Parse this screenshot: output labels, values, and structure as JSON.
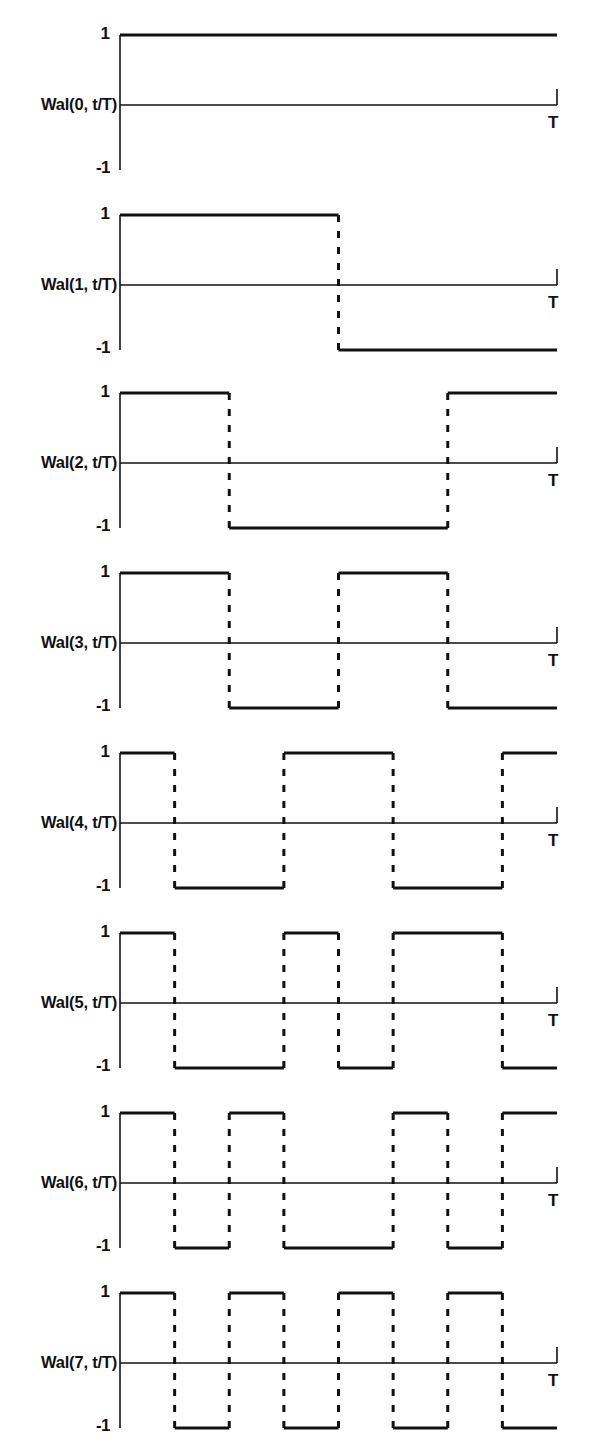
{
  "figure": {
    "title": "",
    "width": 590,
    "height": 1444,
    "ink_color": "#111111",
    "background_color": "#ffffff",
    "solid_stroke_width": 3.2,
    "dashed_stroke_width": 3.0,
    "axis_stroke_width": 1.6,
    "dash_pattern": "7 9"
  },
  "geometry": {
    "panel_height": 180,
    "panel_top_offsets": [
      0,
      180,
      358,
      538,
      718,
      898,
      1078,
      1258
    ],
    "x_axis_left": 120,
    "x_axis_right": 557,
    "y_high": 35,
    "y_zero": 105,
    "y_low": 170,
    "end_tick_height": 16,
    "label_right_edge": 117,
    "t_label_x": 548
  },
  "chart_data": {
    "type": "line",
    "xlabel": "t/T",
    "ylabel": "",
    "xlim": [
      0,
      1
    ],
    "ylim": [
      -1,
      1
    ],
    "grid": false,
    "legend": "none",
    "x_tick_labels": [
      "T"
    ],
    "x_tick_values": [
      1
    ],
    "y_tick_labels": [
      "1",
      "-1"
    ],
    "y_tick_values": [
      1,
      -1
    ],
    "segment_denominator": 8,
    "series": [
      {
        "name": "Wal(0, t/T)",
        "index": 0,
        "values": [
          1,
          1,
          1,
          1,
          1,
          1,
          1,
          1
        ],
        "breakpoints": [],
        "high_intervals": [
          [
            0,
            1
          ]
        ],
        "low_intervals": []
      },
      {
        "name": "Wal(1, t/T)",
        "index": 1,
        "values": [
          1,
          1,
          1,
          1,
          -1,
          -1,
          -1,
          -1
        ],
        "breakpoints": [
          0.5
        ],
        "high_intervals": [
          [
            0,
            0.5
          ]
        ],
        "low_intervals": [
          [
            0.5,
            1
          ]
        ]
      },
      {
        "name": "Wal(2, t/T)",
        "index": 2,
        "values": [
          1,
          1,
          -1,
          -1,
          -1,
          -1,
          1,
          1
        ],
        "breakpoints": [
          0.25,
          0.75
        ],
        "high_intervals": [
          [
            0,
            0.25
          ],
          [
            0.75,
            1
          ]
        ],
        "low_intervals": [
          [
            0.25,
            0.75
          ]
        ]
      },
      {
        "name": "Wal(3, t/T)",
        "index": 3,
        "values": [
          1,
          1,
          -1,
          -1,
          1,
          1,
          -1,
          -1
        ],
        "breakpoints": [
          0.25,
          0.5,
          0.75
        ],
        "high_intervals": [
          [
            0,
            0.25
          ],
          [
            0.5,
            0.75
          ]
        ],
        "low_intervals": [
          [
            0.25,
            0.5
          ],
          [
            0.75,
            1
          ]
        ]
      },
      {
        "name": "Wal(4, t/T)",
        "index": 4,
        "values": [
          1,
          -1,
          -1,
          1,
          1,
          -1,
          -1,
          1
        ],
        "breakpoints": [
          0.125,
          0.375,
          0.625,
          0.875
        ],
        "high_intervals": [
          [
            0,
            0.125
          ],
          [
            0.375,
            0.625
          ],
          [
            0.875,
            1
          ]
        ],
        "low_intervals": [
          [
            0.125,
            0.375
          ],
          [
            0.625,
            0.875
          ]
        ]
      },
      {
        "name": "Wal(5, t/T)",
        "index": 5,
        "values": [
          1,
          -1,
          -1,
          1,
          -1,
          1,
          1,
          -1
        ],
        "breakpoints": [
          0.125,
          0.375,
          0.5,
          0.625,
          0.875
        ],
        "high_intervals": [
          [
            0,
            0.125
          ],
          [
            0.375,
            0.5
          ],
          [
            0.625,
            0.875
          ]
        ],
        "low_intervals": [
          [
            0.125,
            0.375
          ],
          [
            0.5,
            0.625
          ],
          [
            0.875,
            1
          ]
        ]
      },
      {
        "name": "Wal(6, t/T)",
        "index": 6,
        "values": [
          1,
          -1,
          1,
          -1,
          -1,
          1,
          -1,
          1
        ],
        "breakpoints": [
          0.125,
          0.25,
          0.375,
          0.625,
          0.75,
          0.875
        ],
        "high_intervals": [
          [
            0,
            0.125
          ],
          [
            0.25,
            0.375
          ],
          [
            0.625,
            0.75
          ],
          [
            0.875,
            1
          ]
        ],
        "low_intervals": [
          [
            0.125,
            0.25
          ],
          [
            0.375,
            0.625
          ],
          [
            0.75,
            0.875
          ]
        ]
      },
      {
        "name": "Wal(7, t/T)",
        "index": 7,
        "values": [
          1,
          -1,
          1,
          -1,
          1,
          -1,
          1,
          -1
        ],
        "breakpoints": [
          0.125,
          0.25,
          0.375,
          0.5,
          0.625,
          0.75,
          0.875
        ],
        "high_intervals": [
          [
            0,
            0.125
          ],
          [
            0.25,
            0.375
          ],
          [
            0.5,
            0.625
          ],
          [
            0.75,
            0.875
          ]
        ],
        "low_intervals": [
          [
            0.125,
            0.25
          ],
          [
            0.375,
            0.5
          ],
          [
            0.625,
            0.75
          ],
          [
            0.875,
            1
          ]
        ]
      }
    ]
  }
}
